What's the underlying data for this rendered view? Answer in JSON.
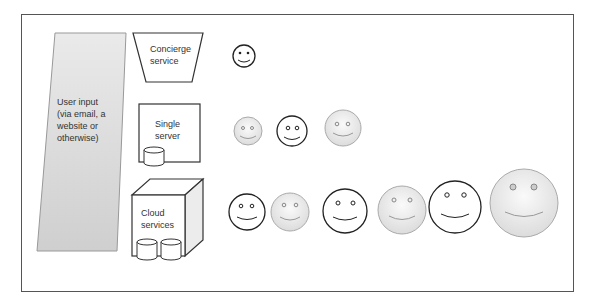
{
  "diagram": {
    "user_input": {
      "label_lines": [
        "User input",
        "(via email, a",
        "website or",
        "otherwise)"
      ]
    },
    "tiers": [
      {
        "name": "concierge",
        "label_lines": [
          "Concierge",
          "service"
        ],
        "smiley_count": 1
      },
      {
        "name": "single-server",
        "label_lines": [
          "Single",
          "server"
        ],
        "smiley_count": 3
      },
      {
        "name": "cloud",
        "label_lines": [
          "Cloud",
          "services"
        ],
        "smiley_count": 6
      }
    ],
    "colors": {
      "border": "#555555",
      "user_input_fill": "#d9d9d9",
      "smiley_fill": "#efefef",
      "stroke": "#222222"
    }
  }
}
